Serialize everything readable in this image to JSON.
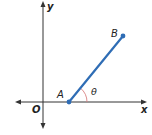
{
  "diagram": {
    "type": "coordinate-plane-segment",
    "axes": {
      "x_label": "x",
      "y_label": "y",
      "origin_label": "O",
      "color": "#333333"
    },
    "segment": {
      "start_label": "A",
      "end_label": "B",
      "color": "#2f6db5"
    },
    "angle": {
      "label": "θ",
      "arc_color": "#d98080"
    }
  }
}
